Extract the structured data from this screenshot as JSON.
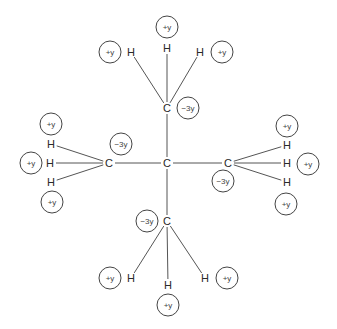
{
  "diagram": {
    "atoms": [
      {
        "id": "C0",
        "label": "C",
        "x": 167,
        "y": 163
      },
      {
        "id": "C1",
        "label": "C",
        "x": 167,
        "y": 108,
        "charge": "−3y",
        "cx": 188,
        "cy": 108
      },
      {
        "id": "C2",
        "label": "C",
        "x": 109,
        "y": 163,
        "charge": "−3y",
        "cx": 121,
        "cy": 144
      },
      {
        "id": "C3",
        "label": "C",
        "x": 228,
        "y": 163,
        "charge": "−3y",
        "cx": 223,
        "cy": 181
      },
      {
        "id": "C4",
        "label": "C",
        "x": 167,
        "y": 221,
        "charge": "−3y",
        "cx": 147,
        "cy": 221
      },
      {
        "id": "H1a",
        "label": "H",
        "x": 167,
        "y": 48,
        "charge": "+y",
        "cx": 167,
        "cy": 27,
        "parent": "C1"
      },
      {
        "id": "H1b",
        "label": "H",
        "x": 131,
        "y": 52,
        "charge": "+y",
        "cx": 110,
        "cy": 52,
        "parent": "C1"
      },
      {
        "id": "H1c",
        "label": "H",
        "x": 200,
        "y": 52,
        "charge": "+y",
        "cx": 222,
        "cy": 52,
        "parent": "C1"
      },
      {
        "id": "H2a",
        "label": "H",
        "x": 51,
        "y": 144,
        "charge": "+y",
        "cx": 51,
        "cy": 124,
        "parent": "C2"
      },
      {
        "id": "H2b",
        "label": "H",
        "x": 50,
        "y": 163,
        "charge": "+y",
        "cx": 31,
        "cy": 163,
        "parent": "C2"
      },
      {
        "id": "H2c",
        "label": "H",
        "x": 51,
        "y": 182,
        "charge": "+y",
        "cx": 52,
        "cy": 202,
        "parent": "C2"
      },
      {
        "id": "H3a",
        "label": "H",
        "x": 287,
        "y": 145,
        "charge": "+y",
        "cx": 287,
        "cy": 126,
        "parent": "C3"
      },
      {
        "id": "H3b",
        "label": "H",
        "x": 287,
        "y": 163,
        "charge": "+y",
        "cx": 308,
        "cy": 164,
        "parent": "C3"
      },
      {
        "id": "H3c",
        "label": "H",
        "x": 287,
        "y": 182,
        "charge": "+y",
        "cx": 286,
        "cy": 204,
        "parent": "C3"
      },
      {
        "id": "H4a",
        "label": "H",
        "x": 131,
        "y": 278,
        "charge": "+y",
        "cx": 110,
        "cy": 278,
        "parent": "C4"
      },
      {
        "id": "H4b",
        "label": "H",
        "x": 168,
        "y": 285,
        "charge": "+y",
        "cx": 168,
        "cy": 305,
        "parent": "C4"
      },
      {
        "id": "H4c",
        "label": "H",
        "x": 205,
        "y": 278,
        "charge": "+y",
        "cx": 227,
        "cy": 278,
        "parent": "C4"
      }
    ],
    "bonds": [
      [
        "C0",
        "C1"
      ],
      [
        "C0",
        "C2"
      ],
      [
        "C0",
        "C3"
      ],
      [
        "C0",
        "C4"
      ],
      [
        "C1",
        "H1a"
      ],
      [
        "C1",
        "H1b"
      ],
      [
        "C1",
        "H1c"
      ],
      [
        "C2",
        "H2a"
      ],
      [
        "C2",
        "H2b"
      ],
      [
        "C2",
        "H2c"
      ],
      [
        "C3",
        "H3a"
      ],
      [
        "C3",
        "H3b"
      ],
      [
        "C3",
        "H3c"
      ],
      [
        "C4",
        "H4a"
      ],
      [
        "C4",
        "H4b"
      ],
      [
        "C4",
        "H4c"
      ]
    ]
  }
}
